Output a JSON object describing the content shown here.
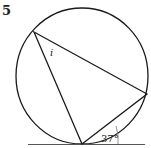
{
  "question_number": "5",
  "unknown_label": "i",
  "angle_label": "37°",
  "colors": {
    "stroke": "#1a1a1a",
    "tangent": "#555555"
  }
}
